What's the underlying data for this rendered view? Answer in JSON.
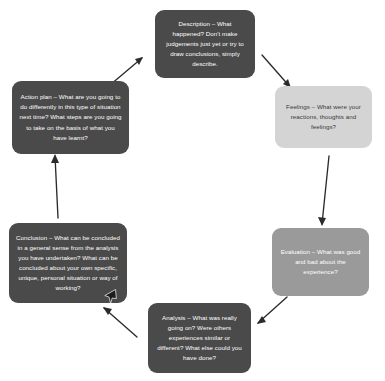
{
  "diagram": {
    "type": "cycle",
    "background_color": "#ffffff",
    "node_count": 6,
    "nodes": [
      {
        "id": "description",
        "label": "Description",
        "text": "Description – What happened? Don't make judgements just yet or try to draw conclusions, simply describe.",
        "style": "dark",
        "fill": "#4a4a4a",
        "text_color": "#ffffff",
        "position": "top-center"
      },
      {
        "id": "feelings",
        "label": "Feelings",
        "text": "Feelings – What were your reactions, thoughts and feelings?",
        "style": "light",
        "fill": "#d4d4d4",
        "text_color": "#3a3a3a",
        "position": "right-upper"
      },
      {
        "id": "evaluation",
        "label": "Evaluation",
        "text": "Evaluation – What was good and bad about the experience?",
        "style": "mid",
        "fill": "#9a9a9a",
        "text_color": "#ffffff",
        "position": "right-lower"
      },
      {
        "id": "analysis",
        "label": "Analysis",
        "text": "Analysis – What was really going on? Were others experiences similar or different? What else could you have done?",
        "style": "dark",
        "fill": "#4a4a4a",
        "text_color": "#ffffff",
        "position": "bottom-center"
      },
      {
        "id": "conclusion",
        "label": "Conclusion",
        "text": "Conclusion – What can be concluded in a general sense from the analysis you have undertaken? What can be concluded about your own specific, unique, personal situation or way of working?",
        "style": "dark",
        "fill": "#4a4a4a",
        "text_color": "#ffffff",
        "position": "left-lower"
      },
      {
        "id": "action_plan",
        "label": "Action plan",
        "text": "Action plan – What are you going to do differently in this type of situation next time? What steps are you going to take on the basis of what you have learnt?",
        "style": "dark",
        "fill": "#4a4a4a",
        "text_color": "#ffffff",
        "position": "left-upper"
      }
    ],
    "arrows": [
      {
        "from": "description",
        "to": "feelings",
        "direction": "down-right"
      },
      {
        "from": "feelings",
        "to": "evaluation",
        "direction": "down"
      },
      {
        "from": "evaluation",
        "to": "analysis",
        "direction": "down-left"
      },
      {
        "from": "analysis",
        "to": "conclusion",
        "direction": "up-left"
      },
      {
        "from": "conclusion",
        "to": "action_plan",
        "direction": "up"
      },
      {
        "from": "action_plan",
        "to": "description",
        "direction": "up-right"
      }
    ],
    "arrow_color": "#2b2b2b",
    "cursor": {
      "type": "mouse-pointer",
      "x": 104,
      "y": 289
    }
  }
}
